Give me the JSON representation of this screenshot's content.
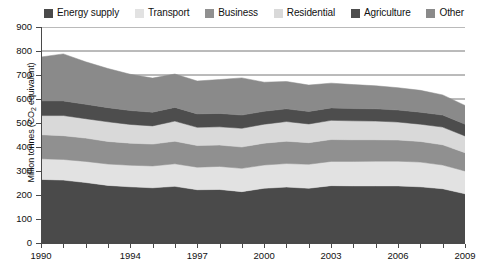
{
  "chart_data": {
    "type": "area",
    "stacked": true,
    "title": "",
    "subtitle": "",
    "xlabel": "",
    "ylabel": "Million tonnes (CO2 equivalent)",
    "ylabel_parts": {
      "before": "Million tonnes (CO",
      "sub": "2",
      "after": " equivalent)"
    },
    "grid": true,
    "grid_axis": "y",
    "legend_position": "top",
    "xlim": [
      1990,
      2009
    ],
    "ylim": [
      0,
      900
    ],
    "ytick_step": 100,
    "yticks": [
      0,
      100,
      200,
      300,
      400,
      500,
      600,
      700,
      800,
      900
    ],
    "ytick_labels": [
      "0",
      "100",
      "200",
      "300",
      "400",
      "500",
      "600",
      "700",
      "800",
      "900"
    ],
    "x": [
      1990,
      1991,
      1992,
      1993,
      1994,
      1995,
      1996,
      1997,
      1998,
      1999,
      2000,
      2001,
      2002,
      2003,
      2004,
      2005,
      2006,
      2007,
      2008,
      2009
    ],
    "xtick_labels": [
      "1990",
      "",
      "",
      "",
      "1994",
      "",
      "",
      "1997",
      "",
      "",
      "2000",
      "",
      "",
      "2003",
      "",
      "",
      "2006",
      "",
      "",
      "2009"
    ],
    "xticks_labeled": [
      1990,
      1994,
      1997,
      2000,
      2003,
      2006,
      2009
    ],
    "series": [
      {
        "name": "Energy supply",
        "color": "#4a4a4a",
        "values": [
          265,
          262,
          252,
          240,
          234,
          230,
          236,
          222,
          223,
          214,
          228,
          233,
          228,
          239,
          238,
          238,
          238,
          234,
          226,
          205
        ]
      },
      {
        "name": "Transport",
        "color": "#e2e2e2",
        "values": [
          86,
          86,
          88,
          89,
          90,
          91,
          94,
          94,
          96,
          97,
          97,
          98,
          100,
          101,
          102,
          103,
          103,
          103,
          99,
          95
        ]
      },
      {
        "name": "Business",
        "color": "#909090",
        "values": [
          100,
          99,
          97,
          94,
          92,
          91,
          94,
          90,
          89,
          89,
          91,
          93,
          90,
          91,
          90,
          89,
          88,
          86,
          84,
          76
        ]
      },
      {
        "name": "Residential",
        "color": "#d9d9d9",
        "values": [
          80,
          84,
          81,
          82,
          78,
          76,
          84,
          76,
          76,
          78,
          79,
          82,
          78,
          80,
          79,
          78,
          75,
          72,
          74,
          70
        ]
      },
      {
        "name": "Agriculture",
        "color": "#4d4d4d",
        "values": [
          61,
          61,
          60,
          59,
          58,
          57,
          57,
          56,
          56,
          55,
          54,
          53,
          52,
          52,
          51,
          51,
          50,
          50,
          50,
          49
        ]
      },
      {
        "name": "Other",
        "color": "#8a8a8a",
        "values": [
          183,
          196,
          177,
          163,
          151,
          142,
          139,
          137,
          141,
          155,
          121,
          114,
          110,
          103,
          100,
          96,
          93,
          91,
          84,
          78
        ]
      }
    ],
    "totals": [
      775,
      788,
      755,
      727,
      703,
      687,
      704,
      675,
      681,
      688,
      670,
      673,
      658,
      666,
      660,
      655,
      647,
      636,
      617,
      573
    ]
  },
  "legend": {
    "items": [
      {
        "label": "Energy supply",
        "color": "#4a4a4a"
      },
      {
        "label": "Transport",
        "color": "#e2e2e2"
      },
      {
        "label": "Business",
        "color": "#909090"
      },
      {
        "label": "Residential",
        "color": "#d9d9d9"
      },
      {
        "label": "Agriculture",
        "color": "#4d4d4d"
      },
      {
        "label": "Other",
        "color": "#8a8a8a"
      }
    ]
  },
  "axis_colors": {
    "axis_line": "#4a4a4a",
    "gridline": "#777777",
    "text": "#111111"
  }
}
